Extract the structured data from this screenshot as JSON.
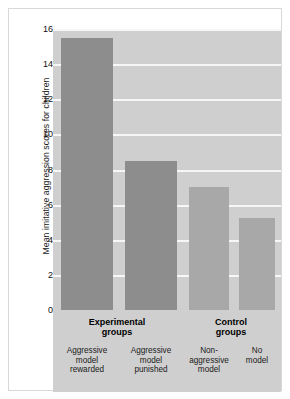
{
  "figure": {
    "y_axis_title": "Mean imitative aggression scores for children",
    "tick_labels": [
      "16",
      "14",
      "12",
      "10",
      "8",
      "6",
      "4",
      "2",
      "0"
    ],
    "groups": [
      {
        "title_line1": "Experimental",
        "title_line2": "groups"
      },
      {
        "title_line1": "Control",
        "title_line2": "groups"
      }
    ],
    "categories": [
      {
        "line1": "Aggressive",
        "line2": "model",
        "line3": "rewarded"
      },
      {
        "line1": "Aggressive",
        "line2": "model",
        "line3": "punished"
      },
      {
        "line1": "Non-",
        "line2": "aggressive",
        "line3": "model"
      },
      {
        "line1": "No",
        "line2": "model",
        "line3": ""
      }
    ]
  },
  "colors": {
    "plot_background": "#cfcfcf",
    "gridline": "#f6f6f6",
    "bar_experimental": "#8d8d8d",
    "bar_control": "#a8a8a8",
    "panel_border": "#d8d8d8",
    "text": "#1a1a1a"
  },
  "chart_data": {
    "type": "bar",
    "title": "",
    "xlabel": "",
    "ylabel": "Mean imitative aggression scores for children",
    "ylim": [
      0,
      16
    ],
    "yticks": [
      0,
      2,
      4,
      6,
      8,
      10,
      12,
      14,
      16
    ],
    "grid": true,
    "legend": "none",
    "categories": [
      "Aggressive model rewarded",
      "Aggressive model punished",
      "Non-aggressive model",
      "No model"
    ],
    "group_labels": [
      "Experimental groups",
      "Control groups"
    ],
    "group_membership": [
      0,
      0,
      1,
      1
    ],
    "values": [
      15.5,
      8.5,
      7.0,
      5.25
    ],
    "bar_colors": [
      "#8d8d8d",
      "#8d8d8d",
      "#a8a8a8",
      "#a8a8a8"
    ]
  }
}
